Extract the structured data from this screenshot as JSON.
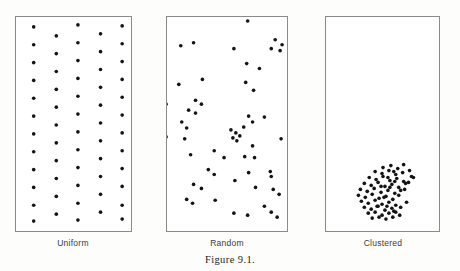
{
  "figure": {
    "number_label": "Figure 9.1.",
    "background_color": "#fdfdfc",
    "panel_border_color": "#8a8a8a",
    "dot_color": "#141414",
    "dot_radius_px": 1.85
  },
  "panels": [
    {
      "name": "uniform",
      "caption": "Uniform",
      "box": {
        "x": 15,
        "y": 16,
        "width": 117,
        "height": 216
      },
      "caption_center_x": 73,
      "caption_y": 238,
      "pattern_type": "uniform",
      "point_count": 55,
      "points": [
        [
          33,
          26
        ],
        [
          78,
          24
        ],
        [
          123,
          25
        ],
        [
          56,
          35
        ],
        [
          101,
          33
        ],
        [
          33,
          44
        ],
        [
          78,
          42
        ],
        [
          123,
          43
        ],
        [
          56,
          53
        ],
        [
          101,
          51
        ],
        [
          33,
          62
        ],
        [
          78,
          60
        ],
        [
          123,
          61
        ],
        [
          56,
          71
        ],
        [
          101,
          69
        ],
        [
          33,
          80
        ],
        [
          78,
          78
        ],
        [
          123,
          79
        ],
        [
          56,
          89
        ],
        [
          101,
          87
        ],
        [
          33,
          98
        ],
        [
          78,
          96
        ],
        [
          123,
          97
        ],
        [
          56,
          107
        ],
        [
          101,
          105
        ],
        [
          33,
          116
        ],
        [
          78,
          114
        ],
        [
          123,
          115
        ],
        [
          56,
          125
        ],
        [
          101,
          123
        ],
        [
          33,
          134
        ],
        [
          78,
          132
        ],
        [
          123,
          133
        ],
        [
          56,
          143
        ],
        [
          101,
          141
        ],
        [
          33,
          152
        ],
        [
          78,
          150
        ],
        [
          123,
          151
        ],
        [
          56,
          161
        ],
        [
          101,
          159
        ],
        [
          33,
          170
        ],
        [
          78,
          168
        ],
        [
          123,
          169
        ],
        [
          56,
          179
        ],
        [
          101,
          177
        ],
        [
          33,
          188
        ],
        [
          78,
          186
        ],
        [
          123,
          187
        ],
        [
          56,
          197
        ],
        [
          101,
          195
        ],
        [
          33,
          206
        ],
        [
          78,
          204
        ],
        [
          123,
          206
        ],
        [
          56,
          215
        ],
        [
          101,
          213
        ],
        [
          33,
          222
        ],
        [
          78,
          221
        ],
        [
          123,
          220
        ]
      ]
    },
    {
      "name": "random",
      "caption": "Random",
      "box": {
        "x": 166,
        "y": 16,
        "width": 122,
        "height": 216
      },
      "caption_center_x": 227,
      "caption_y": 238,
      "pattern_type": "random",
      "point_count": 56,
      "points": [
        [
          248,
          20
        ],
        [
          180,
          45
        ],
        [
          193,
          42
        ],
        [
          276,
          39
        ],
        [
          283,
          44
        ],
        [
          272,
          48
        ],
        [
          281,
          50
        ],
        [
          234,
          48
        ],
        [
          178,
          84
        ],
        [
          202,
          79
        ],
        [
          195,
          100
        ],
        [
          201,
          104
        ],
        [
          165,
          104
        ],
        [
          246,
          82
        ],
        [
          254,
          90
        ],
        [
          260,
          68
        ],
        [
          247,
          63
        ],
        [
          188,
          110
        ],
        [
          195,
          113
        ],
        [
          181,
          122
        ],
        [
          186,
          128
        ],
        [
          249,
          116
        ],
        [
          265,
          117
        ],
        [
          165,
          137
        ],
        [
          184,
          139
        ],
        [
          244,
          127
        ],
        [
          253,
          122
        ],
        [
          231,
          130
        ],
        [
          236,
          133
        ],
        [
          240,
          136
        ],
        [
          233,
          138
        ],
        [
          237,
          141
        ],
        [
          253,
          146
        ],
        [
          282,
          139
        ],
        [
          214,
          151
        ],
        [
          190,
          155
        ],
        [
          224,
          158
        ],
        [
          245,
          157
        ],
        [
          255,
          158
        ],
        [
          208,
          170
        ],
        [
          214,
          175
        ],
        [
          249,
          173
        ],
        [
          271,
          172
        ],
        [
          272,
          177
        ],
        [
          193,
          185
        ],
        [
          201,
          189
        ],
        [
          235,
          181
        ],
        [
          256,
          188
        ],
        [
          274,
          190
        ],
        [
          280,
          195
        ],
        [
          186,
          200
        ],
        [
          192,
          204
        ],
        [
          215,
          201
        ],
        [
          234,
          214
        ],
        [
          248,
          216
        ],
        [
          265,
          207
        ],
        [
          272,
          213
        ],
        [
          278,
          218
        ]
      ]
    },
    {
      "name": "clustered",
      "caption": "Clustered",
      "box": {
        "x": 325,
        "y": 16,
        "width": 115,
        "height": 216
      },
      "caption_center_x": 383,
      "caption_y": 238,
      "pattern_type": "clustered",
      "point_count": 73,
      "points": [
        [
          383,
          168
        ],
        [
          391,
          166
        ],
        [
          398,
          169
        ],
        [
          404,
          165
        ],
        [
          375,
          172
        ],
        [
          382,
          174
        ],
        [
          389,
          171
        ],
        [
          396,
          175
        ],
        [
          403,
          173
        ],
        [
          410,
          171
        ],
        [
          369,
          178
        ],
        [
          376,
          180
        ],
        [
          383,
          177
        ],
        [
          390,
          181
        ],
        [
          397,
          179
        ],
        [
          404,
          182
        ],
        [
          412,
          177
        ],
        [
          364,
          184
        ],
        [
          371,
          186
        ],
        [
          378,
          183
        ],
        [
          385,
          187
        ],
        [
          392,
          185
        ],
        [
          399,
          188
        ],
        [
          406,
          184
        ],
        [
          360,
          190
        ],
        [
          367,
          192
        ],
        [
          374,
          189
        ],
        [
          381,
          193
        ],
        [
          388,
          191
        ],
        [
          395,
          194
        ],
        [
          401,
          191
        ],
        [
          358,
          196
        ],
        [
          365,
          198
        ],
        [
          372,
          195
        ],
        [
          379,
          199
        ],
        [
          386,
          197
        ],
        [
          393,
          200
        ],
        [
          361,
          202
        ],
        [
          368,
          204
        ],
        [
          375,
          201
        ],
        [
          382,
          205
        ],
        [
          389,
          203
        ],
        [
          396,
          206
        ],
        [
          364,
          208
        ],
        [
          371,
          210
        ],
        [
          378,
          207
        ],
        [
          385,
          211
        ],
        [
          392,
          209
        ],
        [
          368,
          214
        ],
        [
          375,
          213
        ],
        [
          382,
          216
        ],
        [
          389,
          214
        ],
        [
          396,
          213
        ],
        [
          372,
          219
        ],
        [
          379,
          218
        ],
        [
          386,
          220
        ],
        [
          393,
          218
        ],
        [
          400,
          216
        ],
        [
          377,
          207
        ],
        [
          384,
          198
        ],
        [
          390,
          188
        ],
        [
          395,
          182
        ],
        [
          399,
          196
        ],
        [
          405,
          190
        ],
        [
          409,
          183
        ],
        [
          414,
          178
        ],
        [
          387,
          207
        ],
        [
          394,
          212
        ],
        [
          401,
          208
        ],
        [
          407,
          203
        ],
        [
          381,
          187
        ],
        [
          388,
          178
        ],
        [
          394,
          172
        ]
      ]
    }
  ]
}
